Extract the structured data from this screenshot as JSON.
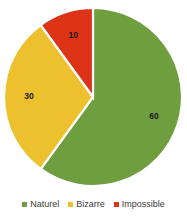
{
  "chart_data": {
    "type": "pie",
    "title": "",
    "categories": [
      "Naturel",
      "Bizarre",
      "Impossible"
    ],
    "values": [
      60,
      30,
      10
    ],
    "labels": [
      "60",
      "30",
      "10"
    ],
    "colors": [
      "#6f9e3f",
      "#edc12e",
      "#dd3317"
    ],
    "legend_position": "bottom",
    "grid": false,
    "start_angle_deg": 0,
    "direction": "clockwise",
    "slices": [
      {
        "name": "Naturel",
        "value": 60,
        "label": "60",
        "color": "#6f9e3f",
        "percent": 60
      },
      {
        "name": "Bizarre",
        "value": 30,
        "label": "30",
        "color": "#edc12e",
        "percent": 30
      },
      {
        "name": "Impossible",
        "value": 10,
        "label": "10",
        "color": "#dd3317",
        "percent": 10
      }
    ]
  },
  "legend": {
    "items": [
      {
        "label": "Naturel",
        "color": "#6f9e3f"
      },
      {
        "label": "Bizarre",
        "color": "#edc12e"
      },
      {
        "label": "Impossible",
        "color": "#dd3317"
      }
    ]
  },
  "background_color": "#ffffff",
  "label_text_color": "#1a1a1a"
}
